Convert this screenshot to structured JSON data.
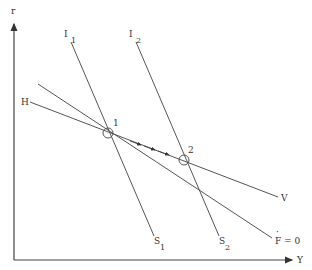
{
  "diagram": {
    "axes": {
      "y_label": "r",
      "x_label": "Y"
    },
    "curves": [
      {
        "id": "I1",
        "label": "I",
        "subscript": "1",
        "end_label": "S",
        "end_subscript": "1"
      },
      {
        "id": "I2",
        "label": "I",
        "subscript": "2",
        "end_label": "S",
        "end_subscript": "2"
      },
      {
        "id": "HV",
        "label": "H",
        "end_label": "V"
      },
      {
        "id": "F0",
        "end_label": "F = 0",
        "end_label_dot": "·"
      }
    ],
    "points": [
      {
        "id": "equilibrium-1",
        "label": "1"
      },
      {
        "id": "equilibrium-2",
        "label": "2"
      }
    ],
    "colors": {
      "line": "#555555",
      "text": "#333333",
      "background": "#ffffff"
    }
  }
}
